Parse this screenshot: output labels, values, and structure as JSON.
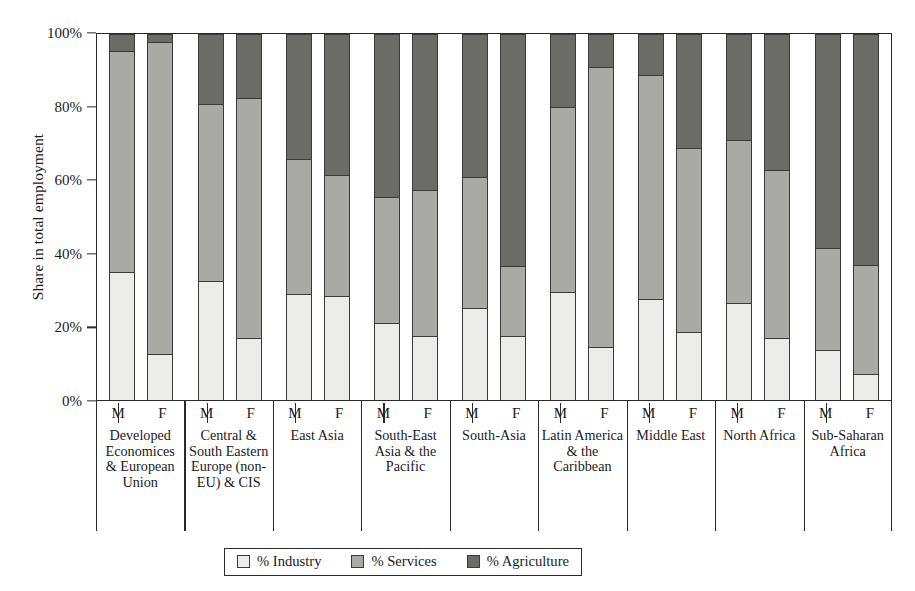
{
  "chart_data": {
    "type": "bar",
    "subtype": "stacked-100-percent-grouped",
    "title": "",
    "xlabel": "",
    "ylabel": "Share in total employment",
    "ylim": [
      0,
      100
    ],
    "yticks": [
      "0%",
      "20%",
      "40%",
      "60%",
      "80%",
      "100%"
    ],
    "ytick_values": [
      0,
      20,
      40,
      60,
      80,
      100
    ],
    "grid": false,
    "legend_position": "bottom",
    "legend": [
      "% Industry",
      "% Services",
      "% Agriculture"
    ],
    "series_colors": {
      "industry": "#ececea",
      "services": "#a9a9a5",
      "agriculture": "#6b6b67"
    },
    "subgroups": [
      "M",
      "F"
    ],
    "categories": [
      "Developed Economices & European Union",
      "Central & South Eastern Europe (non-EU) & CIS",
      "East Asia",
      "South-East Asia & the Pacific",
      "South-Asia",
      "Latin America & the Caribbean",
      "Middle East",
      "North Africa",
      "Sub-Saharan Africa"
    ],
    "bars": [
      {
        "category": "Developed Economices & European Union",
        "sex": "M",
        "industry": 35.0,
        "services": 60.5,
        "agriculture": 4.5
      },
      {
        "category": "Developed Economices & European Union",
        "sex": "F",
        "industry": 12.5,
        "services": 85.5,
        "agriculture": 2.0
      },
      {
        "category": "Central & South Eastern Europe (non-EU) & CIS",
        "sex": "M",
        "industry": 32.5,
        "services": 48.5,
        "agriculture": 19.0
      },
      {
        "category": "Central & South Eastern Europe (non-EU) & CIS",
        "sex": "F",
        "industry": 17.0,
        "services": 65.5,
        "agriculture": 17.5
      },
      {
        "category": "East Asia",
        "sex": "M",
        "industry": 29.0,
        "services": 37.0,
        "agriculture": 34.0
      },
      {
        "category": "East Asia",
        "sex": "F",
        "industry": 28.5,
        "services": 33.0,
        "agriculture": 38.5
      },
      {
        "category": "South-East Asia & the Pacific",
        "sex": "M",
        "industry": 21.0,
        "services": 34.5,
        "agriculture": 44.5
      },
      {
        "category": "South-East Asia & the Pacific",
        "sex": "F",
        "industry": 17.5,
        "services": 40.0,
        "agriculture": 42.5
      },
      {
        "category": "South-Asia",
        "sex": "M",
        "industry": 25.0,
        "services": 36.0,
        "agriculture": 39.0
      },
      {
        "category": "South-Asia",
        "sex": "F",
        "industry": 17.5,
        "services": 19.0,
        "agriculture": 63.5
      },
      {
        "category": "Latin America & the Caribbean",
        "sex": "M",
        "industry": 29.5,
        "services": 50.5,
        "agriculture": 20.0
      },
      {
        "category": "Latin America & the Caribbean",
        "sex": "F",
        "industry": 14.5,
        "services": 76.5,
        "agriculture": 9.0
      },
      {
        "category": "Middle East",
        "sex": "M",
        "industry": 27.5,
        "services": 61.5,
        "agriculture": 11.0
      },
      {
        "category": "Middle East",
        "sex": "F",
        "industry": 18.5,
        "services": 50.5,
        "agriculture": 31.0
      },
      {
        "category": "North Africa",
        "sex": "M",
        "industry": 26.5,
        "services": 44.5,
        "agriculture": 29.0
      },
      {
        "category": "North Africa",
        "sex": "F",
        "industry": 17.0,
        "services": 46.0,
        "agriculture": 37.0
      },
      {
        "category": "Sub-Saharan Africa",
        "sex": "M",
        "industry": 13.5,
        "services": 28.0,
        "agriculture": 58.5
      },
      {
        "category": "Sub-Saharan Africa",
        "sex": "F",
        "industry": 7.0,
        "services": 30.0,
        "agriculture": 63.0
      }
    ]
  },
  "axis": {
    "y_title": "Share in total employment",
    "y_ticks": [
      {
        "label": "100%",
        "value": 100
      },
      {
        "label": "80%",
        "value": 80
      },
      {
        "label": "60%",
        "value": 60
      },
      {
        "label": "40%",
        "value": 40
      },
      {
        "label": "20%",
        "value": 20
      },
      {
        "label": "0%",
        "value": 0
      }
    ]
  },
  "legend": {
    "items": [
      {
        "label": "% Industry",
        "color": "#ececea"
      },
      {
        "label": "% Services",
        "color": "#a9a9a5"
      },
      {
        "label": "% Agriculture",
        "color": "#6b6b67"
      }
    ]
  }
}
